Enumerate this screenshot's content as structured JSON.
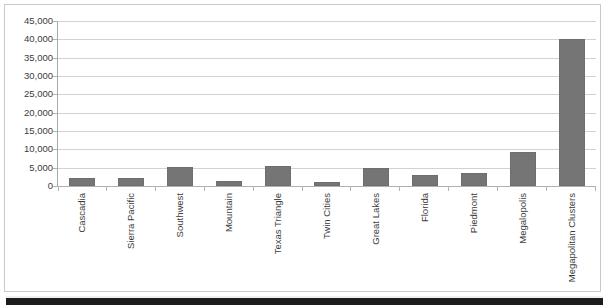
{
  "chart_data": {
    "type": "bar",
    "title": "",
    "xlabel": "",
    "ylabel": "",
    "ylim": [
      0,
      45000
    ],
    "grid": true,
    "legend": "none",
    "ytick_labels": [
      "45,000",
      "40,000",
      "35,000",
      "30,000",
      "25,000",
      "20,000",
      "15,000",
      "10,000",
      "5,000",
      "0"
    ],
    "ytick_values": [
      45000,
      40000,
      35000,
      30000,
      25000,
      20000,
      15000,
      10000,
      5000,
      0
    ],
    "categories": [
      "Cascadia",
      "Sierra Pacific",
      "Southwest",
      "Mountain",
      "Texas Triangle",
      "Twin Cities",
      "Great Lakes",
      "Florida",
      "Piedmont",
      "Megalopolis",
      "Megapolitan Clusters"
    ],
    "values": [
      2200,
      2200,
      5300,
      1500,
      5400,
      1000,
      5000,
      2900,
      3500,
      9400,
      40200
    ],
    "bar_color": "#757575"
  },
  "colors": {
    "bar": "#757575",
    "gridline": "#d2d2d2",
    "axis": "#a8a8a8",
    "text": "#3c3c3c",
    "frame": "#c9c9c9",
    "footer_strip": "#1c1c1c"
  }
}
